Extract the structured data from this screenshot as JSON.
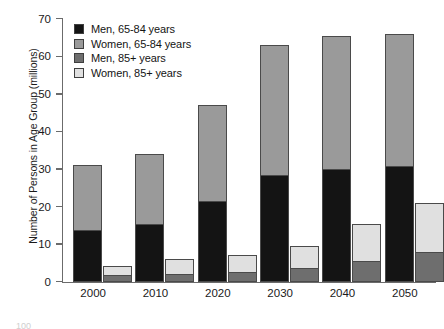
{
  "chart_data": {
    "type": "bar",
    "stacked": true,
    "title": "",
    "xlabel": "",
    "ylabel": "Number of Persons in Age Group (millions)",
    "categories": [
      "2000",
      "2010",
      "2020",
      "2030",
      "2040",
      "2050"
    ],
    "ylim": [
      0,
      70
    ],
    "yticks": [
      0,
      10,
      20,
      30,
      40,
      50,
      60,
      70
    ],
    "ytick_labels": [
      "0",
      "10",
      "20",
      "30",
      "40",
      "50",
      "60",
      "70"
    ],
    "grid": false,
    "legend_position": "upper-left-inside",
    "bar_groups": [
      {
        "name": "65-84 years",
        "series": [
          {
            "name": "Men, 65-84 years",
            "color": "#141414",
            "values": [
              13.5,
              15.0,
              21.3,
              28.0,
              29.7,
              30.6
            ]
          },
          {
            "name": "Women, 65-84 years",
            "color": "#9a9a9a",
            "values": [
              17.5,
              19.0,
              25.7,
              35.0,
              35.8,
              35.2
            ]
          }
        ],
        "totals": [
          31.0,
          34.0,
          47.0,
          63.0,
          65.5,
          65.8
        ]
      },
      {
        "name": "85+ years",
        "series": [
          {
            "name": "Men, 85+ years",
            "color": "#6e6e6e",
            "values": [
              1.5,
              1.8,
              2.2,
              3.3,
              5.3,
              7.6
            ]
          },
          {
            "name": "Women, 85+ years",
            "color": "#e0e0e0",
            "values": [
              2.8,
              4.2,
              4.8,
              6.3,
              10.0,
              13.3
            ]
          }
        ],
        "totals": [
          4.3,
          6.0,
          7.0,
          9.6,
          15.3,
          20.9
        ]
      }
    ],
    "legend": [
      {
        "label": "Men, 65-84 years",
        "color": "#141414"
      },
      {
        "label": "Women, 65-84 years",
        "color": "#9a9a9a"
      },
      {
        "label": "Men, 85+ years",
        "color": "#6e6e6e"
      },
      {
        "label": "Women, 85+ years",
        "color": "#e0e0e0"
      }
    ],
    "colors": {
      "men_65_84": "#141414",
      "women_65_84": "#9a9a9a",
      "men_85plus": "#6e6e6e",
      "women_85plus": "#e0e0e0",
      "axis": "#6b6b6b",
      "bar_outline": "#4a4a4a",
      "text": "#1a1a1a",
      "background": "#ffffff"
    }
  },
  "footer": {
    "artifact_text": "100"
  }
}
